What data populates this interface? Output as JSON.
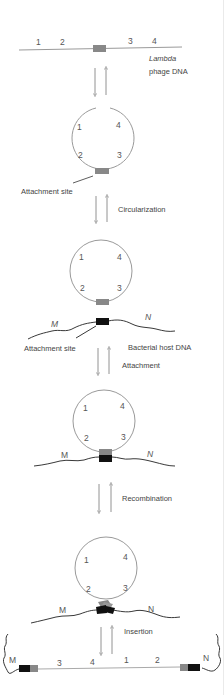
{
  "diagram": {
    "colors": {
      "phage_dna": "#9a9a9a",
      "phage_att_site": "#888888",
      "host_dna": "#222222",
      "host_att_site": "#111111",
      "arrow": "#777777"
    },
    "stage1": {
      "gene_labels": [
        "1",
        "2",
        "3",
        "4"
      ],
      "label_line1": "Lambda",
      "label_line2": "phage DNA"
    },
    "stage2": {
      "gene_labels": [
        "1",
        "4",
        "2",
        "3"
      ],
      "attachment_label": "Attachment site"
    },
    "step1": {
      "label": "Circularization"
    },
    "stage3": {
      "gene_labels": [
        "1",
        "4",
        "2",
        "3"
      ],
      "host_labels": [
        "M",
        "N"
      ],
      "attachment_label": "Attachment site",
      "host_label": "Bacterial host DNA"
    },
    "step2": {
      "label": "Attachment"
    },
    "stage4": {
      "gene_labels": [
        "1",
        "4",
        "2",
        "3"
      ],
      "host_labels": [
        "M",
        "N"
      ]
    },
    "step3": {
      "label": "Recombination"
    },
    "stage5": {
      "gene_labels": [
        "1",
        "4",
        "2",
        "3"
      ],
      "host_labels": [
        "M",
        "N"
      ]
    },
    "step4": {
      "label": "Insertion"
    },
    "stage6": {
      "host_labels": [
        "M",
        "N"
      ],
      "gene_labels": [
        "3",
        "4",
        "1",
        "2"
      ]
    }
  }
}
